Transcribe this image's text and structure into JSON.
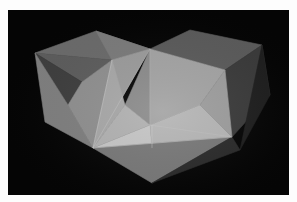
{
  "image": {
    "alt": "Photograph of a gray polyhedral paper model (two joined cube-like forms with triangular facets) on a black background",
    "subject": "polyhedron model",
    "background_color": "#050505",
    "frame_color": "#fdfdfd"
  },
  "facets": [
    {
      "name": "left-top-back",
      "points": "96,31 150,49 112,60 35,53",
      "fill": "#6a6a6a"
    },
    {
      "name": "left-top-front",
      "points": "35,53 112,60 82,82",
      "fill": "#5c5c5c"
    },
    {
      "name": "left-dark-inner",
      "points": "35,53 82,82 68,105",
      "fill": "#3e3e3e"
    },
    {
      "name": "left-top-right",
      "points": "96,31 150,49 112,60",
      "fill": "#7a7a7a"
    },
    {
      "name": "left-side-outer",
      "points": "35,53 68,105 93,148 45,122",
      "fill": "#7e7e7e"
    },
    {
      "name": "left-side-inner",
      "points": "68,105 82,82 112,60 93,148",
      "fill": "#8e8e8e"
    },
    {
      "name": "right-top",
      "points": "150,49 190,30 262,45 225,70",
      "fill": "#5a5a5a"
    },
    {
      "name": "right-side-dark",
      "points": "225,70 262,45 270,95 232,137",
      "fill": "#3a3a3a"
    },
    {
      "name": "right-side-deep",
      "points": "262,45 270,95 240,150",
      "fill": "#1e1e1e"
    },
    {
      "name": "center-left-tri",
      "points": "150,49 112,60 93,148",
      "fill": "#9a9a9a"
    },
    {
      "name": "center-mid-tri",
      "points": "150,49 125,105 150,125",
      "fill": "#8a8a8a"
    },
    {
      "name": "center-left-lower",
      "points": "112,60 125,105 93,148",
      "fill": "#a6a6a6"
    },
    {
      "name": "center-bright-low",
      "points": "93,148 150,125 152,148",
      "fill": "#c4c4c4"
    },
    {
      "name": "center-low-mid",
      "points": "125,105 150,125 93,148",
      "fill": "#b0b0b0"
    },
    {
      "name": "right-front-upper",
      "points": "150,49 225,70 200,105 150,125",
      "fill": "#a2a2a2"
    },
    {
      "name": "right-front-lower",
      "points": "150,125 200,105 232,137 152,148",
      "fill": "#b4b4b4"
    },
    {
      "name": "right-front-edge",
      "points": "200,105 225,70 232,137",
      "fill": "#9c9c9c"
    },
    {
      "name": "bottom-face",
      "points": "93,148 232,137 152,183",
      "fill": "#777777"
    },
    {
      "name": "bottom-shadow-right",
      "points": "232,137 240,150 152,183",
      "fill": "#2a2a2a"
    }
  ],
  "edges": [
    {
      "points": "150,49 93,148",
      "stroke": "#c8c8c8"
    },
    {
      "points": "150,49 150,125",
      "stroke": "#b8b8b8"
    },
    {
      "points": "112,60 93,148",
      "stroke": "#cfcfcf"
    },
    {
      "points": "150,125 232,137",
      "stroke": "#c0c0c0"
    },
    {
      "points": "152,148 152,125",
      "stroke": "#d0d0d0"
    },
    {
      "points": "93,148 232,137",
      "stroke": "#d8d8d8"
    }
  ]
}
